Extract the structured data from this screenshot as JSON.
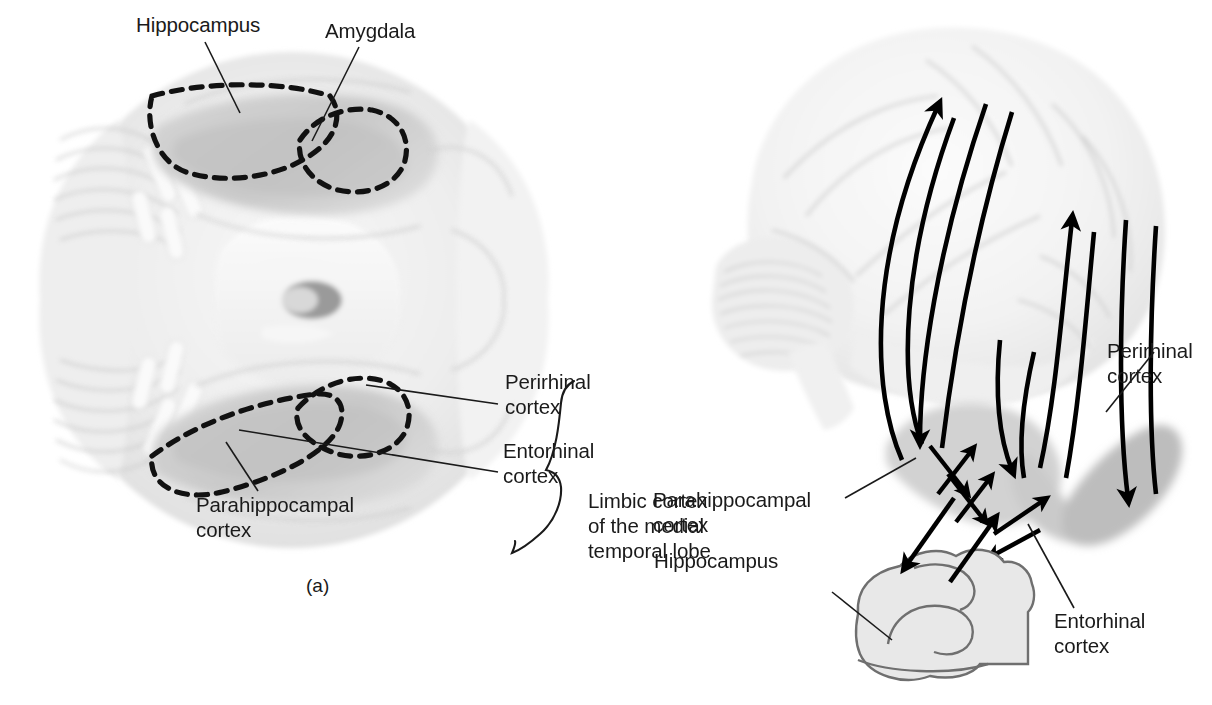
{
  "figure": {
    "title": "Limbic cortex of the medial temporal lobe",
    "background_color": "#ffffff",
    "ink_color": "#1a1a1a",
    "brain_gray_light": "#d2d2d2",
    "brain_gray_dark": "#bdbdbd",
    "hippocampus_fill": "#e8e8e8"
  },
  "panel_a": {
    "letter": "(a)",
    "view": "ventral-view-of-human-brain",
    "labels": {
      "hippocampus": "Hippocampus",
      "amygdala": "Amygdala",
      "perirhinal_cortex": "Perirhinal\ncortex",
      "entorhinal_cortex": "Entorhinal\ncortex",
      "parahippocampal_cortex": "Parahippocampal\ncortex",
      "limbic_cortex": "Limbic cortex\nof the medial\ntemporal lobe"
    }
  },
  "panel_b": {
    "view": "lateral-view-of-human-brain-with-connection-arrows",
    "labels": {
      "perirhinal_cortex": "Perirhinal\ncortex",
      "parahippocampal_cortex": "Parahippocampal\ncortex",
      "hippocampus": "Hippocampus",
      "entorhinal_cortex": "Entorhinal\ncortex"
    }
  }
}
